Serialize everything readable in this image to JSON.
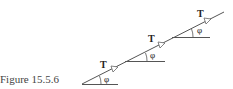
{
  "caption": "Figure 15.5.6",
  "labels": {
    "tension": "T",
    "angle": "φ"
  },
  "segments": [
    {
      "tension_label": "T",
      "angle_label": "φ"
    },
    {
      "tension_label": "T",
      "angle_label": "φ"
    },
    {
      "tension_label": "T",
      "angle_label": "φ"
    }
  ],
  "colors": {
    "line": "#555555",
    "text": "#222222"
  }
}
